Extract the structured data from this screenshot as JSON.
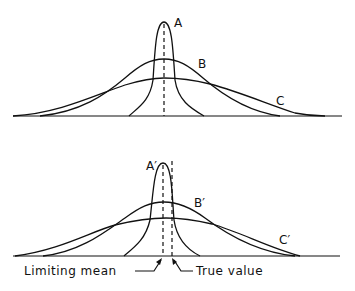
{
  "diagram": {
    "top_panel": {
      "curves": [
        {
          "id": "A",
          "label": "A",
          "description": "narrow, tall distribution"
        },
        {
          "id": "B",
          "label": "B",
          "description": "medium-width distribution"
        },
        {
          "id": "C",
          "label": "C",
          "description": "broad, flat distribution"
        }
      ]
    },
    "bottom_panel": {
      "curves": [
        {
          "id": "A2",
          "label": "A′"
        },
        {
          "id": "B2",
          "label": "B′"
        },
        {
          "id": "C2",
          "label": "C′"
        }
      ],
      "annotations": {
        "limiting_mean": "Limiting mean",
        "true_value": "True value"
      }
    }
  }
}
